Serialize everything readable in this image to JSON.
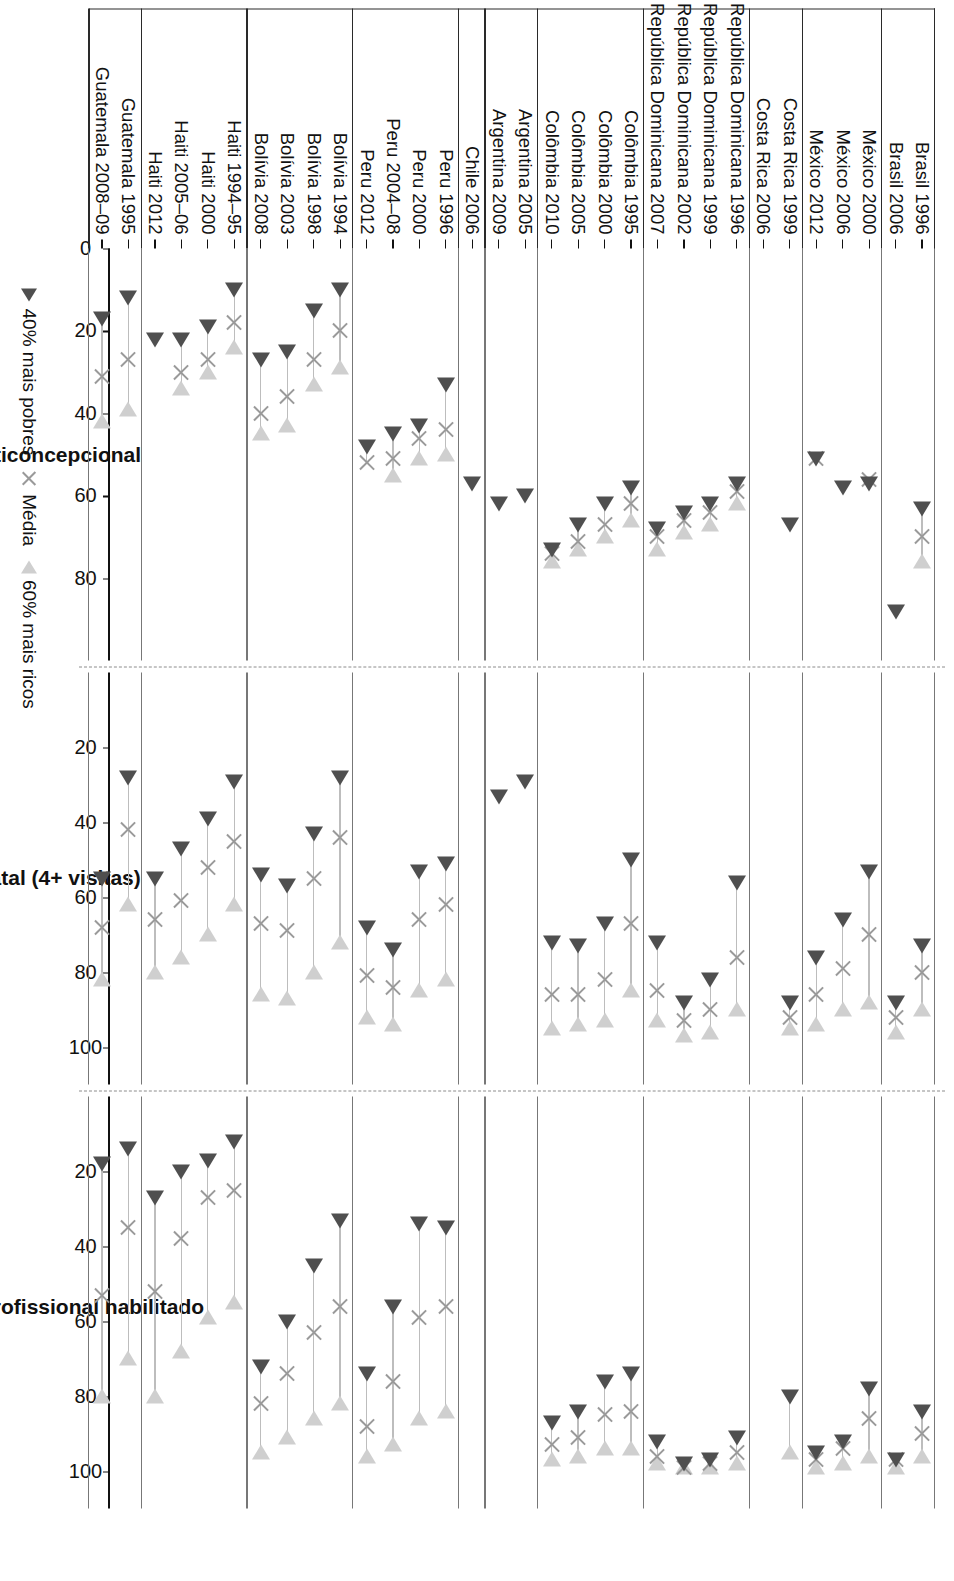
{
  "legend": {
    "items": [
      {
        "key": "poorest",
        "label": "40% mais pobres",
        "marker": "triangle-right-dark",
        "color": "#4f4f4f"
      },
      {
        "key": "mean",
        "label": "Média",
        "marker": "x-mark",
        "color": "#9a9a9a"
      },
      {
        "key": "richest",
        "label": "60% mais ricos",
        "marker": "triangle-left-light",
        "color": "#cfcfcf"
      }
    ]
  },
  "chart_data": {
    "type": "scatter",
    "title": "",
    "orientation": "horizontal-dot-range",
    "xlabel": "",
    "ylabel": "",
    "grid": false,
    "legend_position": "bottom-right",
    "panels": [
      {
        "id": "prevalencia",
        "title": "Prevalência anticoncepcional",
        "xlim": [
          0,
          100
        ],
        "ticks": [
          0,
          20,
          40,
          60,
          80
        ],
        "ticklabels": [
          "0",
          "20",
          "40",
          "60",
          "80"
        ]
      },
      {
        "id": "prenatal",
        "title": "Cuidado pré-natal (4+ visitas)",
        "xlim": [
          0,
          110
        ],
        "ticks": [
          20,
          40,
          60,
          80,
          100
        ],
        "ticklabels": [
          "20",
          "40",
          "60",
          "80",
          "100"
        ]
      },
      {
        "id": "parto",
        "title": "Parto assistido por profissional habilitado",
        "xlim": [
          0,
          110
        ],
        "ticks": [
          20,
          40,
          60,
          80,
          100
        ],
        "ticklabels": [
          "20",
          "40",
          "60",
          "80",
          "100"
        ]
      }
    ],
    "groups": [
      {
        "name": "Brasil",
        "rows": [
          "Brasil 1996",
          "Brasil 2006"
        ]
      },
      {
        "name": "México",
        "rows": [
          "México 2000",
          "México 2006",
          "México 2012"
        ]
      },
      {
        "name": "Costa Rica",
        "rows": [
          "Costa Rica 1999",
          "Costa Rica 2006"
        ]
      },
      {
        "name": "República Dominicana",
        "rows": [
          "República Dominicana 1996",
          "República Dominicana 1999",
          "República Dominicana 2002",
          "República Dominicana 2007"
        ]
      },
      {
        "name": "Colômbia",
        "rows": [
          "Colômbia 1995",
          "Colômbia 2000",
          "Colômbia 2005",
          "Colômbia 2010"
        ]
      },
      {
        "name": "Argentina",
        "rows": [
          "Argentina 2005",
          "Argentina 2009"
        ]
      },
      {
        "name": "Chile",
        "rows": [
          "Chile 2006"
        ]
      },
      {
        "name": "Peru",
        "rows": [
          "Peru 1996",
          "Peru 2000",
          "Peru 2004–08",
          "Peru 2012"
        ]
      },
      {
        "name": "Bolívia",
        "rows": [
          "Bolívia 1994",
          "Bolívia 1998",
          "Bolívia 2003",
          "Bolívia 2008"
        ]
      },
      {
        "name": "Haiti",
        "rows": [
          "Haiti 1994–95",
          "Haiti 2000",
          "Haiti 2005–06",
          "Haiti 2012"
        ]
      },
      {
        "name": "Guatemala",
        "rows": [
          "Guatemala 1995",
          "Guatemala 2008–09"
        ]
      }
    ],
    "categories": [
      "Brasil 1996",
      "Brasil 2006",
      "México 2000",
      "México 2006",
      "México 2012",
      "Costa Rica 1999",
      "Costa Rica 2006",
      "República Dominicana 1996",
      "República Dominicana 1999",
      "República Dominicana 2002",
      "República Dominicana 2007",
      "Colômbia 1995",
      "Colômbia 2000",
      "Colômbia 2005",
      "Colômbia 2010",
      "Argentina 2005",
      "Argentina 2009",
      "Chile 2006",
      "Peru 1996",
      "Peru 2000",
      "Peru 2004–08",
      "Peru 2012",
      "Bolívia 1994",
      "Bolívia 1998",
      "Bolívia 2003",
      "Bolívia 2008",
      "Haiti 1994–95",
      "Haiti 2000",
      "Haiti 2005–06",
      "Haiti 2012",
      "Guatemala 1995",
      "Guatemala 2008–09"
    ],
    "series_by_panel": {
      "prevalencia": {
        "poorest": [
          63,
          88,
          57,
          58,
          51,
          67,
          null,
          57,
          62,
          64,
          68,
          58,
          62,
          67,
          73,
          60,
          62,
          57,
          33,
          43,
          45,
          48,
          10,
          15,
          25,
          27,
          10,
          19,
          22,
          22,
          12,
          17
        ],
        "mean": [
          70,
          null,
          56,
          null,
          51,
          null,
          null,
          59,
          64,
          66,
          70,
          62,
          67,
          71,
          74,
          null,
          null,
          null,
          44,
          46,
          51,
          52,
          20,
          27,
          36,
          40,
          18,
          27,
          30,
          null,
          27,
          31
        ],
        "richest": [
          76,
          null,
          null,
          null,
          null,
          null,
          null,
          62,
          67,
          69,
          73,
          66,
          70,
          73,
          76,
          null,
          null,
          null,
          50,
          51,
          55,
          null,
          29,
          33,
          43,
          45,
          24,
          30,
          34,
          null,
          39,
          42
        ]
      },
      "prenatal": {
        "poorest": [
          73,
          88,
          53,
          66,
          76,
          88,
          null,
          56,
          82,
          88,
          72,
          50,
          67,
          73,
          72,
          29,
          33,
          null,
          51,
          53,
          74,
          68,
          28,
          43,
          57,
          54,
          29,
          39,
          47,
          55,
          28,
          55
        ],
        "mean": [
          80,
          92,
          70,
          79,
          86,
          92,
          null,
          76,
          90,
          93,
          85,
          67,
          82,
          86,
          86,
          null,
          null,
          null,
          62,
          66,
          84,
          81,
          44,
          55,
          69,
          67,
          45,
          52,
          61,
          66,
          42,
          68
        ],
        "richest": [
          90,
          96,
          88,
          90,
          94,
          95,
          null,
          90,
          96,
          97,
          93,
          85,
          93,
          94,
          95,
          null,
          null,
          null,
          82,
          85,
          94,
          92,
          72,
          80,
          87,
          86,
          62,
          70,
          76,
          80,
          62,
          82
        ]
      },
      "parto": {
        "poorest": [
          84,
          97,
          78,
          92,
          95,
          80,
          null,
          91,
          97,
          98,
          92,
          74,
          76,
          84,
          87,
          null,
          null,
          null,
          35,
          34,
          56,
          74,
          33,
          45,
          60,
          72,
          12,
          17,
          20,
          27,
          14,
          18
        ],
        "mean": [
          90,
          97,
          86,
          94,
          97,
          null,
          null,
          95,
          98,
          99,
          96,
          84,
          85,
          91,
          93,
          null,
          null,
          null,
          56,
          59,
          76,
          88,
          56,
          63,
          74,
          82,
          25,
          27,
          38,
          52,
          35,
          53
        ],
        "richest": [
          96,
          99,
          96,
          98,
          99,
          95,
          null,
          98,
          99,
          99,
          98,
          94,
          94,
          96,
          97,
          null,
          null,
          null,
          84,
          86,
          93,
          96,
          82,
          86,
          91,
          95,
          55,
          59,
          68,
          80,
          70,
          80
        ]
      }
    }
  }
}
